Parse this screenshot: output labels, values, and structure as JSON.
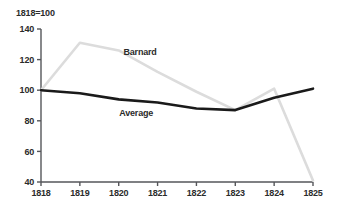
{
  "chart_data": {
    "type": "line",
    "title": "1818=100",
    "xlabel": "",
    "ylabel": "",
    "grid": false,
    "legend_position": "inline-annotation",
    "x": [
      1818,
      1819,
      1820,
      1821,
      1822,
      1823,
      1824,
      1825
    ],
    "xtick_labels": [
      "1818",
      "1819",
      "1820",
      "1821",
      "1822",
      "1823",
      "1824",
      "1825"
    ],
    "ytick_labels": [
      "40",
      "60",
      "80",
      "100",
      "120",
      "140"
    ],
    "yticks": [
      40,
      60,
      80,
      100,
      120,
      140
    ],
    "ylim": [
      40,
      140
    ],
    "xlim": [
      1818,
      1825
    ],
    "series": [
      {
        "name": "Barnard",
        "color": "#dcdcdc",
        "label_x": 1820.55,
        "label_y": 123,
        "values": [
          100,
          131,
          126,
          112,
          99,
          87,
          101,
          41
        ]
      },
      {
        "name": "Average",
        "color": "#1a1a1a",
        "label_x": 1820.45,
        "label_y": 83,
        "values": [
          100,
          98,
          94,
          92,
          88,
          87,
          95,
          101
        ]
      }
    ]
  },
  "axis": {
    "color": "#55565a",
    "tick_length": 4
  }
}
